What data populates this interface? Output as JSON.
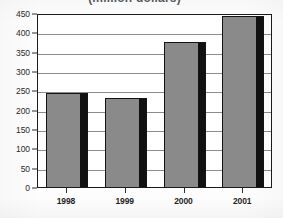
{
  "chart_data": {
    "type": "bar",
    "title": "(million dollars)",
    "title_note": "title is clipped by the top edge of the scan; only the lower portion of the glyphs is visible",
    "xlabel": "",
    "ylabel": "",
    "categories": [
      "1998",
      "1999",
      "2000",
      "2001"
    ],
    "values": [
      242,
      230,
      375,
      443
    ],
    "series": [
      {
        "name": "value",
        "values": [
          242,
          230,
          375,
          443
        ]
      }
    ],
    "ylim": [
      0,
      450
    ],
    "ytick_labels": [
      "450",
      "400",
      "350",
      "300",
      "250",
      "200",
      "150",
      "100",
      "50",
      "0"
    ],
    "ytick_values": [
      450,
      400,
      350,
      300,
      250,
      200,
      150,
      100,
      50,
      0
    ],
    "ytick_step": 50,
    "grid": "horizontal",
    "legend": "none",
    "bar_fill_color": "#8a8a8a",
    "bar_side_color": "#111111",
    "bar_outline_color": "#141414",
    "gridline_color": "#8c8c8c",
    "frame_color": "#1b1b1b",
    "background_color": "#fdfdfd"
  }
}
